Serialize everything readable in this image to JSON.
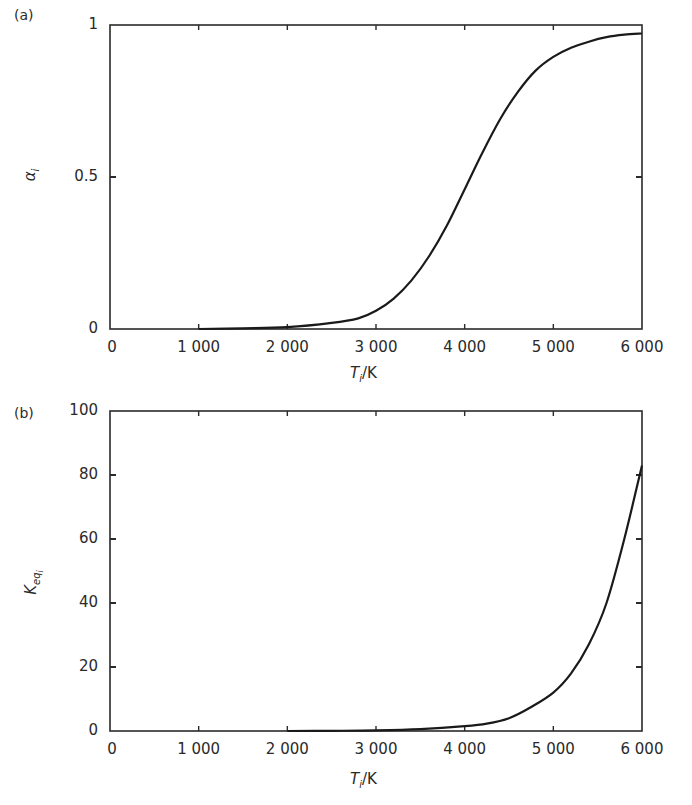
{
  "figure": {
    "panels": [
      {
        "id": "a",
        "panel_label": "(a)",
        "ylabel": "α_i",
        "ylabel_main": "α",
        "ylabel_sub": "i",
        "xlabel_main": "T",
        "xlabel_sub": "i",
        "xlabel_unit": "/K",
        "yticks": [
          "0",
          "0.5",
          "1"
        ],
        "xticks": [
          "0",
          "1 000",
          "2 000",
          "3 000",
          "4 000",
          "5 000",
          "6 000"
        ]
      },
      {
        "id": "b",
        "panel_label": "(b)",
        "ylabel": "K_eq_i",
        "ylabel_main": "K",
        "ylabel_sub": "eq",
        "ylabel_subsub": "i",
        "xlabel_main": "T",
        "xlabel_sub": "i",
        "xlabel_unit": "/K",
        "yticks": [
          "0",
          "20",
          "40",
          "60",
          "80",
          "100"
        ],
        "xticks": [
          "0",
          "1 000",
          "2 000",
          "3 000",
          "4 000",
          "5 000",
          "6 000"
        ]
      }
    ],
    "line_color": "#1a1a1a",
    "axis_color": "#2a2a2a"
  },
  "chart_data": [
    {
      "type": "line",
      "title": "(a)",
      "xlabel": "T_i/K",
      "ylabel": "α_i",
      "xlim": [
        0,
        6000
      ],
      "ylim": [
        0,
        1
      ],
      "grid": false,
      "legend": null,
      "x_ticks": [
        0,
        1000,
        2000,
        3000,
        4000,
        5000,
        6000
      ],
      "y_ticks": [
        0,
        0.5,
        1
      ],
      "series": [
        {
          "name": "alpha_i",
          "x": [
            1000,
            1500,
            2000,
            2500,
            2800,
            3000,
            3200,
            3400,
            3600,
            3800,
            4000,
            4200,
            4400,
            4600,
            4800,
            5000,
            5200,
            5400,
            5600,
            5800,
            6000
          ],
          "y": [
            0.0,
            0.002,
            0.006,
            0.02,
            0.035,
            0.06,
            0.1,
            0.16,
            0.24,
            0.34,
            0.46,
            0.58,
            0.69,
            0.78,
            0.85,
            0.895,
            0.925,
            0.945,
            0.96,
            0.968,
            0.972
          ]
        }
      ]
    },
    {
      "type": "line",
      "title": "(b)",
      "xlabel": "T_i/K",
      "ylabel": "K_eq_i",
      "xlim": [
        0,
        6000
      ],
      "ylim": [
        0,
        100
      ],
      "grid": false,
      "legend": null,
      "x_ticks": [
        0,
        1000,
        2000,
        3000,
        4000,
        5000,
        6000
      ],
      "y_ticks": [
        0,
        20,
        40,
        60,
        80,
        100
      ],
      "series": [
        {
          "name": "K_eq_i",
          "x": [
            2000,
            2500,
            3000,
            3500,
            4000,
            4250,
            4500,
            4750,
            5000,
            5200,
            5400,
            5600,
            5800,
            6000
          ],
          "y": [
            0.0,
            0.05,
            0.2,
            0.6,
            1.5,
            2.3,
            4.0,
            7.5,
            12.0,
            18.0,
            27.0,
            40.0,
            60.0,
            83.0
          ]
        }
      ]
    }
  ]
}
